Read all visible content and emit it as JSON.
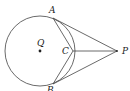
{
  "diagram": {
    "type": "geometry",
    "labels": {
      "A": "A",
      "B": "B",
      "C": "C",
      "P": "P",
      "Q": "Q"
    },
    "points": {
      "Q": [
        40,
        51
      ],
      "A": [
        53,
        18
      ],
      "B": [
        53,
        83
      ],
      "C": [
        73,
        51
      ],
      "P": [
        117,
        51
      ]
    },
    "circle": {
      "center": "Q",
      "radius": 35
    },
    "segments": [
      [
        "A",
        "P"
      ],
      [
        "B",
        "P"
      ],
      [
        "C",
        "P"
      ],
      [
        "A",
        "C"
      ],
      [
        "B",
        "C"
      ]
    ],
    "stroke_color": "#444444"
  }
}
